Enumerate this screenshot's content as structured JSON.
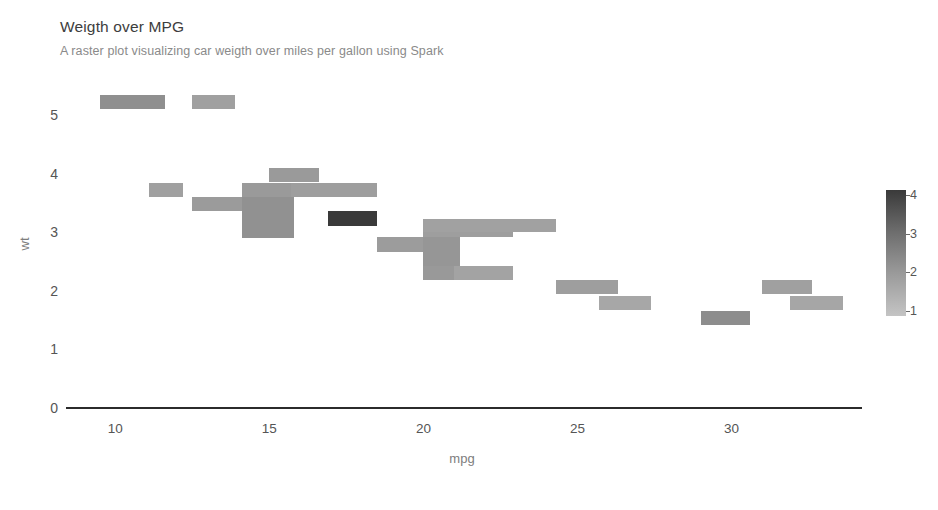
{
  "header": {
    "title": "Weigth over MPG",
    "subtitle": "A raster plot visualizing car weigth over miles per gallon using Spark"
  },
  "chart_data": {
    "type": "heatmap",
    "title": "Weigth over MPG",
    "subtitle": "A raster plot visualizing car weigth over miles per gallon using Spark",
    "xlabel": "mpg",
    "ylabel": "wt",
    "xlim": [
      8.4,
      34.2
    ],
    "ylim": [
      0,
      5.6
    ],
    "xticks": [
      10,
      15,
      20,
      25,
      30
    ],
    "yticks": [
      0,
      1,
      2,
      3,
      4,
      5
    ],
    "grid": false,
    "legend": {
      "position": "right",
      "title": "",
      "ticks": [
        4,
        3,
        2,
        1
      ],
      "min_value": 1,
      "max_value": 4,
      "color_low": "#c4c4c4",
      "color_high": "#3a3a3a"
    },
    "value_label": "count",
    "cells": [
      {
        "x0": 9.5,
        "x1": 11.6,
        "y0": 5.1,
        "y1": 5.34,
        "value": 2.9,
        "color": "#8f8f8f"
      },
      {
        "x0": 12.5,
        "x1": 13.9,
        "y0": 5.1,
        "y1": 5.34,
        "value": 2.2,
        "color": "#a0a0a0"
      },
      {
        "x0": 11.1,
        "x1": 12.2,
        "y0": 3.6,
        "y1": 3.85,
        "value": 2.2,
        "color": "#a0a0a0"
      },
      {
        "x0": 12.5,
        "x1": 14.2,
        "y0": 3.36,
        "y1": 3.6,
        "value": 2.4,
        "color": "#9b9b9b"
      },
      {
        "x0": 14.1,
        "x1": 15.8,
        "y0": 3.6,
        "y1": 3.85,
        "value": 2.5,
        "color": "#9a9a9a"
      },
      {
        "x0": 14.1,
        "x1": 15.8,
        "y0": 2.9,
        "y1": 3.6,
        "value": 2.8,
        "color": "#919191"
      },
      {
        "x0": 15.0,
        "x1": 16.6,
        "y0": 3.85,
        "y1": 4.1,
        "value": 2.5,
        "color": "#9a9a9a"
      },
      {
        "x0": 15.7,
        "x1": 18.5,
        "y0": 3.6,
        "y1": 3.85,
        "value": 2.3,
        "color": "#9e9e9e"
      },
      {
        "x0": 16.9,
        "x1": 18.5,
        "y0": 3.1,
        "y1": 3.36,
        "value": 4.0,
        "color": "#3a3a3a"
      },
      {
        "x0": 18.5,
        "x1": 20.1,
        "y0": 2.66,
        "y1": 2.92,
        "value": 2.4,
        "color": "#9c9c9c"
      },
      {
        "x0": 20.0,
        "x1": 22.9,
        "y0": 2.92,
        "y1": 3.18,
        "value": 2.3,
        "color": "#9e9e9e"
      },
      {
        "x0": 20.0,
        "x1": 21.2,
        "y0": 2.42,
        "y1": 2.92,
        "value": 2.6,
        "color": "#969696"
      },
      {
        "x0": 20.0,
        "x1": 24.3,
        "y0": 3.0,
        "y1": 3.22,
        "value": 2.2,
        "color": "#a1a1a1"
      },
      {
        "x0": 20.0,
        "x1": 21.2,
        "y0": 2.18,
        "y1": 2.42,
        "value": 2.5,
        "color": "#999999"
      },
      {
        "x0": 21.0,
        "x1": 22.9,
        "y0": 2.18,
        "y1": 2.42,
        "value": 2.1,
        "color": "#a3a3a3"
      },
      {
        "x0": 24.3,
        "x1": 26.3,
        "y0": 1.95,
        "y1": 2.18,
        "value": 2.3,
        "color": "#9e9e9e"
      },
      {
        "x0": 25.7,
        "x1": 27.4,
        "y0": 1.68,
        "y1": 1.92,
        "value": 2.0,
        "color": "#a7a7a7"
      },
      {
        "x0": 29.0,
        "x1": 30.6,
        "y0": 1.42,
        "y1": 1.66,
        "value": 2.9,
        "color": "#8d8d8d"
      },
      {
        "x0": 31.0,
        "x1": 32.6,
        "y0": 1.95,
        "y1": 2.18,
        "value": 2.2,
        "color": "#a0a0a0"
      },
      {
        "x0": 31.9,
        "x1": 33.6,
        "y0": 1.68,
        "y1": 1.92,
        "value": 2.0,
        "color": "#a6a6a6"
      }
    ]
  }
}
